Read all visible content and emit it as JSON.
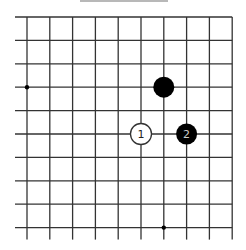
{
  "diagram": {
    "type": "go-board-fragment",
    "grid": {
      "columns": 10,
      "rows": 10,
      "origin_x": 27,
      "origin_y": 17,
      "spacing_x": 22.8,
      "spacing_y": 23.4,
      "line_color": "#333333",
      "edges": {
        "top": "board-edge",
        "right": "board-edge",
        "left": "continues",
        "bottom": "continues"
      }
    },
    "star_points": [
      {
        "col": 0,
        "row": 3
      },
      {
        "col": 6,
        "row": 9
      }
    ],
    "stones": [
      {
        "col": 6,
        "row": 3,
        "color": "black",
        "label": ""
      },
      {
        "col": 5,
        "row": 5,
        "color": "white",
        "label": "1"
      },
      {
        "col": 7,
        "row": 5,
        "color": "black",
        "label": "2"
      }
    ],
    "colors": {
      "black_stone": "#000000",
      "white_stone_fill": "#ffffff",
      "white_stone_stroke": "#333333",
      "black_label": "#cccccc",
      "white_label": "#222222",
      "background": "#ffffff"
    }
  }
}
